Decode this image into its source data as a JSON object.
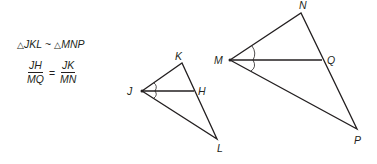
{
  "statement": {
    "triangle1": "JKL",
    "similar_symbol": "~",
    "triangle2": "MNP",
    "triangle_symbol": "△"
  },
  "proportion": {
    "left_numerator": "JH",
    "left_denominator": "MQ",
    "equals": "=",
    "right_numerator": "JK",
    "right_denominator": "MN"
  },
  "small_triangle": {
    "vertices": {
      "J": {
        "label": "J",
        "x": 142,
        "y": 91
      },
      "K": {
        "label": "K",
        "x": 182,
        "y": 63
      },
      "L": {
        "label": "L",
        "x": 217,
        "y": 139
      },
      "H": {
        "label": "H",
        "x": 194,
        "y": 91
      }
    }
  },
  "large_triangle": {
    "vertices": {
      "M": {
        "label": "M",
        "x": 230,
        "y": 60
      },
      "N": {
        "label": "N",
        "x": 301,
        "y": 13
      },
      "P": {
        "label": "P",
        "x": 357,
        "y": 129
      },
      "Q": {
        "label": "Q",
        "x": 322,
        "y": 60
      }
    }
  },
  "colors": {
    "stroke": "#231f20",
    "background": "#ffffff"
  }
}
